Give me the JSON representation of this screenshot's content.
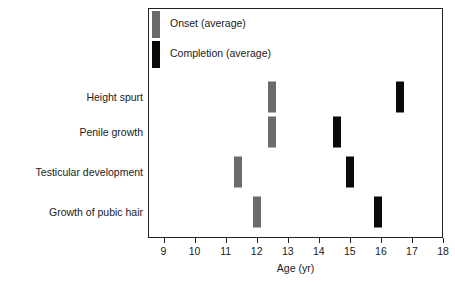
{
  "chart_data": {
    "type": "bar",
    "title": "",
    "xlabel": "Age (yr)",
    "ylabel": "",
    "xlim": [
      8.5,
      18.0
    ],
    "xticks": [
      9,
      10,
      11,
      12,
      13,
      14,
      15,
      16,
      17,
      18
    ],
    "xtick_labels": [
      "9",
      "10",
      "11",
      "12",
      "13",
      "14",
      "15",
      "16",
      "17",
      "18"
    ],
    "grid": false,
    "legend_position": "top-left",
    "categories": [
      "Height spurt",
      "Penile growth",
      "Testicular development",
      "Growth of pubic hair"
    ],
    "series": [
      {
        "name": "Onset (average)",
        "color": "#6b6b6b",
        "values": [
          12.5,
          12.5,
          11.4,
          12.0
        ]
      },
      {
        "name": "Completion (average)",
        "color": "#0a0a0a",
        "values": [
          16.6,
          14.6,
          15.0,
          15.9
        ]
      }
    ],
    "markers": [
      {
        "category": "Height spurt",
        "series": "Onset (average)",
        "age": 12.5
      },
      {
        "category": "Height spurt",
        "series": "Completion (average)",
        "age": 16.6
      },
      {
        "category": "Penile growth",
        "series": "Onset (average)",
        "age": 12.5
      },
      {
        "category": "Penile growth",
        "series": "Completion (average)",
        "age": 14.6
      },
      {
        "category": "Testicular development",
        "series": "Onset (average)",
        "age": 11.4
      },
      {
        "category": "Testicular development",
        "series": "Completion (average)",
        "age": 15.0
      },
      {
        "category": "Growth of pubic hair",
        "series": "Onset (average)",
        "age": 12.0
      },
      {
        "category": "Growth of pubic hair",
        "series": "Completion (average)",
        "age": 15.9
      }
    ]
  },
  "legend": {
    "items": [
      {
        "label": "Onset (average)",
        "swatch": "onset-swatch"
      },
      {
        "label": "Completion (average)",
        "swatch": "completion-swatch"
      }
    ]
  },
  "axis": {
    "x_title": "Age (yr)"
  },
  "colors": {
    "onset": "#6b6b6b",
    "completion": "#0a0a0a",
    "frame": "#222222",
    "background": "#ffffff",
    "text": "#1a1a1a"
  }
}
